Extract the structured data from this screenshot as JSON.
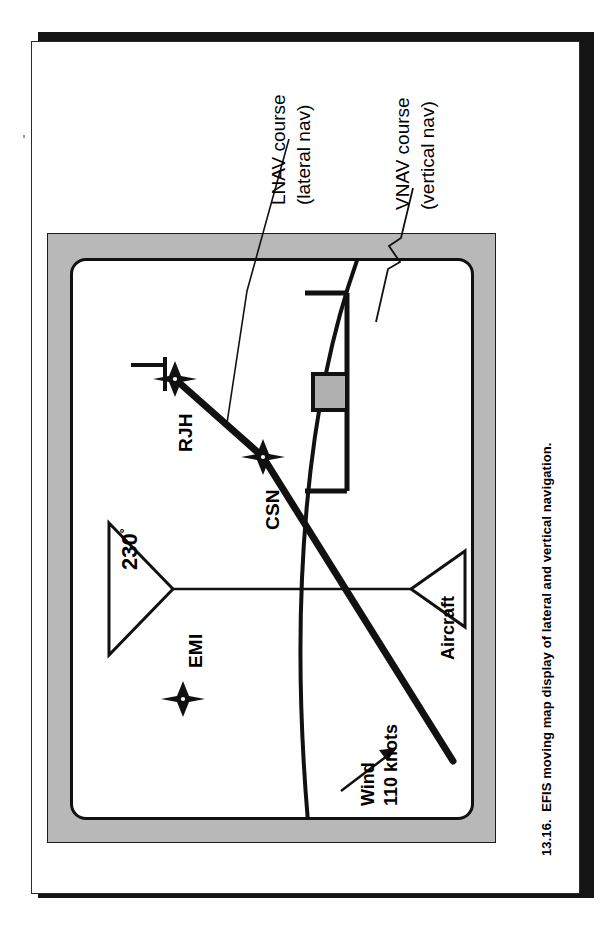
{
  "document": {
    "type": "scanned-book-page",
    "figure_number": "13.16.",
    "caption": "13.16.  EFIS moving map display of lateral and vertical navigation.",
    "caption_text_only": "EFIS moving map display of lateral and vertical navigation.",
    "page_orientation": "figure rotated 90 degrees counter-clockwise on the page"
  },
  "colors": {
    "page_background": "#ffffff",
    "page_shadow": "#141414",
    "bezel_gray": "#b8b8b8",
    "ink_black": "#111111",
    "vnav_box_fill": "#b0b0b0"
  },
  "figure": {
    "title": "EFIS moving map display",
    "callouts": [
      {
        "id": "lnav",
        "line1": "LNAV course",
        "line2": "(lateral nav)",
        "full": "LNAV course (lateral nav)",
        "leader": "straight diagonal leader line into the map area"
      },
      {
        "id": "vnav",
        "line1": "VNAV course",
        "line2": "(vertical nav)",
        "full": "VNAV course (vertical nav)",
        "leader": "zig-zag (lightning bolt) leader line into the VNAV deviation scale"
      }
    ],
    "display": {
      "heading_indicator": {
        "value": "230",
        "degree_symbol": "°",
        "label": "230°",
        "shape": "open triangle pointer at top of compass/track line"
      },
      "waypoints": [
        {
          "name": "EMI",
          "symbol": "four-point-star"
        },
        {
          "name": "RJH",
          "symbol": "four-point-star"
        },
        {
          "name": "CSN",
          "symbol": "four-point-star"
        }
      ],
      "aircraft": {
        "label": "Aircraft",
        "symbol": "open triangle aircraft symbol"
      },
      "wind": {
        "line1": "Wind",
        "line2": "110 knots",
        "full": "Wind 110 knots",
        "speed_value": 110,
        "speed_unit": "knots",
        "symbol": "arrow"
      },
      "vnav_scale": {
        "description": "horizontal deviation bracket with center pointer",
        "pointer": "gray square deviation marker on center tick"
      },
      "range_arc": {
        "description": "curved range ring arc crossing the display"
      },
      "course_lines": [
        {
          "from": "Aircraft",
          "to": "CSN",
          "style": "thick solid"
        },
        {
          "from": "CSN",
          "to": "RJH",
          "style": "thick solid"
        }
      ]
    }
  }
}
